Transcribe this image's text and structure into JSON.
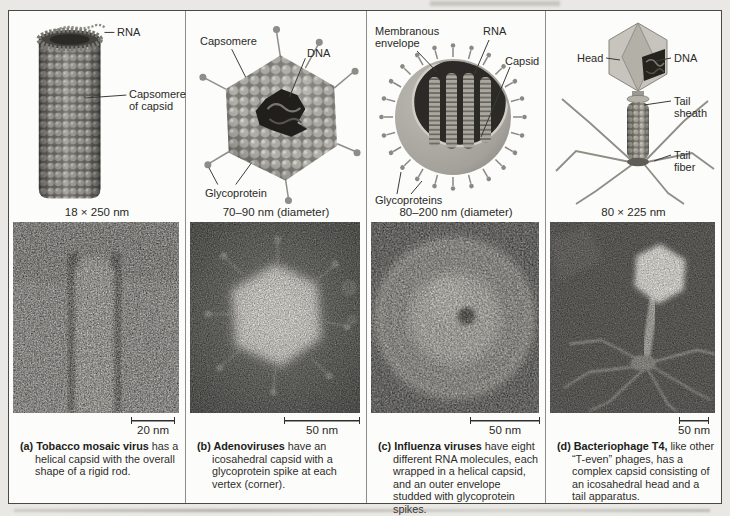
{
  "figure": {
    "panels": [
      {
        "id": "a",
        "size_label": "18 × 250 nm",
        "scale_bar_label": "20 nm",
        "caption_lead": "(a) Tobacco mosaic virus",
        "caption_rest": " has a helical capsid with the overall shape of a rigid rod.",
        "labels": {
          "rna": "RNA",
          "capsomere": "Capsomere of capsid"
        }
      },
      {
        "id": "b",
        "size_label": "70–90 nm (diameter)",
        "scale_bar_label": "50 nm",
        "caption_lead": "(b) Adenoviruses",
        "caption_rest": " have an icosahedral capsid with a glycoprotein spike at each vertex (corner).",
        "labels": {
          "capsomere": "Capsomere",
          "dna": "DNA",
          "glycoprotein": "Glycoprotein"
        }
      },
      {
        "id": "c",
        "size_label": "80–200 nm (diameter)",
        "scale_bar_label": "50 nm",
        "caption_lead": "(c) Influenza viruses",
        "caption_rest": " have eight different RNA molecules, each wrapped in a helical capsid, and an outer envelope studded with glycoprotein spikes.",
        "labels": {
          "membranous_envelope": "Membranous envelope",
          "rna": "RNA",
          "capsid": "Capsid",
          "glycoproteins": "Glycoproteins"
        }
      },
      {
        "id": "d",
        "size_label": "80 × 225 nm",
        "scale_bar_label": "50 nm",
        "caption_lead": "(d) Bacteriophage T4,",
        "caption_rest": " like other “T-even” phages, has a complex capsid consisting of an icosahedral head and a tail apparatus.",
        "labels": {
          "head": "Head",
          "dna": "DNA",
          "tail_sheath": "Tail sheath",
          "tail_fiber": "Tail fiber"
        }
      }
    ]
  }
}
